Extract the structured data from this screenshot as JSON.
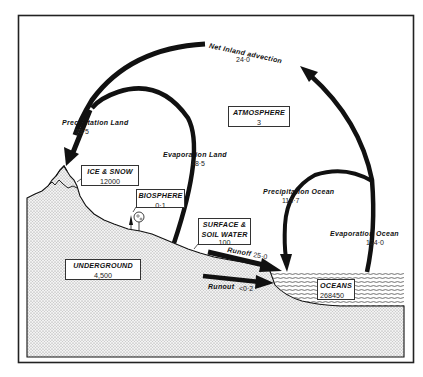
{
  "reservoirs": [
    {
      "id": "atmosphere",
      "label": "ATMOSPHERE",
      "value": "3"
    },
    {
      "id": "ice_snow",
      "label": "ICE & SNOW",
      "value": "12000"
    },
    {
      "id": "biosphere",
      "label": "BIOSPHERE",
      "value": "0·1"
    },
    {
      "id": "surface_soil",
      "label_line1": "SURFACE &",
      "label_line2": "SOIL WATER",
      "value": "100"
    },
    {
      "id": "underground",
      "label": "UNDERGROUND",
      "value": "4,500"
    },
    {
      "id": "oceans",
      "label": "OCEANS",
      "value": "268450"
    }
  ],
  "fluxes": [
    {
      "id": "net_inland_advection",
      "label": "Net Inland  advection",
      "value": "24·0"
    },
    {
      "id": "precipitation_land",
      "label": "Precipitation  Land",
      "value": "73·5"
    },
    {
      "id": "evaporation_land",
      "label": "Evaporation  Land",
      "value": "48·5"
    },
    {
      "id": "precipitation_ocean",
      "label": "Precipitation  Ocean",
      "value": "113·7"
    },
    {
      "id": "evaporation_ocean",
      "label": "Evaporation  Ocean",
      "value": "124·0"
    },
    {
      "id": "runoff",
      "label": "Runoff",
      "value": "25·0"
    },
    {
      "id": "runout",
      "label": "Runout",
      "value": "<0·2"
    }
  ],
  "colors": {
    "ink": "#111111",
    "ground_fill": "#e4e4e4",
    "frame": "#222222",
    "background": "#ffffff"
  }
}
